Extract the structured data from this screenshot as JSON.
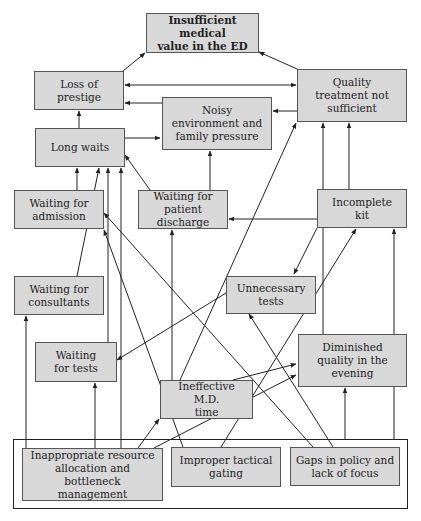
{
  "diagram": {
    "nodes": [
      {
        "id": "insufficient",
        "label": "Insufficient medical\nvalue in the ED",
        "bold": true
      },
      {
        "id": "loss_prestige",
        "label": "Loss of\nprestige"
      },
      {
        "id": "quality_treatment",
        "label": "Quality\ntreatment not\nsufficient"
      },
      {
        "id": "noisy",
        "label": "Noisy\nenvironment and\nfamily pressure"
      },
      {
        "id": "long_waits",
        "label": "Long waits"
      },
      {
        "id": "wait_admission",
        "label": "Waiting for\nadmission"
      },
      {
        "id": "wait_discharge",
        "label": "Waiting for\npatient discharge"
      },
      {
        "id": "incomplete_kit",
        "label": "Incomplete\nkit"
      },
      {
        "id": "wait_consultants",
        "label": "Waiting for\nconsultants"
      },
      {
        "id": "unnecessary_tests",
        "label": "Unnecessary\ntests"
      },
      {
        "id": "wait_tests",
        "label": "Waiting\nfor tests"
      },
      {
        "id": "diminished_quality",
        "label": "Diminished\nquality in the\nevening"
      },
      {
        "id": "ineffective_md",
        "label": "Ineffective M.D.\ntime"
      },
      {
        "id": "inappropriate",
        "label": "Inappropriate resource\nallocation and bottleneck\nmanagement"
      },
      {
        "id": "improper_gating",
        "label": "Improper tactical\ngating"
      },
      {
        "id": "gaps_policy",
        "label": "Gaps in policy and\nlack of focus"
      }
    ],
    "edges": [
      {
        "from": "loss_prestige",
        "to": "insufficient"
      },
      {
        "from": "quality_treatment",
        "to": "insufficient"
      },
      {
        "from": "loss_prestige",
        "to": "quality_treatment",
        "bidirectional": true
      },
      {
        "from": "noisy",
        "to": "loss_prestige"
      },
      {
        "from": "quality_treatment",
        "to": "noisy"
      },
      {
        "from": "long_waits",
        "to": "loss_prestige"
      },
      {
        "from": "long_waits",
        "to": "noisy"
      },
      {
        "from": "wait_discharge",
        "to": "noisy"
      },
      {
        "from": "wait_admission",
        "to": "long_waits"
      },
      {
        "from": "wait_consultants",
        "to": "long_waits"
      },
      {
        "from": "wait_tests",
        "to": "long_waits"
      },
      {
        "from": "inappropriate",
        "to": "long_waits"
      },
      {
        "from": "wait_discharge",
        "to": "long_waits"
      },
      {
        "from": "incomplete_kit",
        "to": "wait_discharge"
      },
      {
        "from": "incomplete_kit",
        "to": "quality_treatment"
      },
      {
        "from": "incomplete_kit",
        "to": "unnecessary_tests"
      },
      {
        "from": "ineffective_md",
        "to": "quality_treatment"
      },
      {
        "from": "diminished_quality",
        "to": "quality_treatment"
      },
      {
        "from": "gaps_policy",
        "to": "wait_admission"
      },
      {
        "from": "improper_gating",
        "to": "wait_admission"
      },
      {
        "from": "ineffective_md",
        "to": "wait_discharge"
      },
      {
        "from": "unnecessary_tests",
        "to": "wait_tests"
      },
      {
        "from": "improper_gating",
        "to": "incomplete_kit"
      },
      {
        "from": "gaps_policy",
        "to": "unnecessary_tests"
      },
      {
        "from": "gaps_policy",
        "to": "incomplete_kit"
      },
      {
        "from": "inappropriate",
        "to": "wait_consultants"
      },
      {
        "from": "inappropriate",
        "to": "wait_tests"
      },
      {
        "from": "inappropriate",
        "to": "ineffective_md"
      },
      {
        "from": "inappropriate",
        "to": "diminished_quality"
      },
      {
        "from": "ineffective_md",
        "to": "diminished_quality"
      },
      {
        "from": "gaps_policy",
        "to": "diminished_quality"
      }
    ],
    "colors": {
      "node_fill": "#d8d8d8",
      "node_border": "#555555",
      "edge": "#222222",
      "background": "#ffffff"
    }
  }
}
